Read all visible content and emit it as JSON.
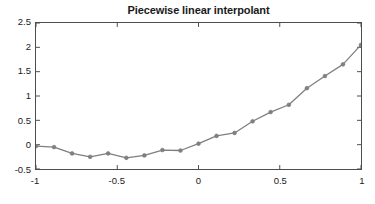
{
  "chart_data": {
    "type": "line",
    "title": "Piecewise linear interpolant",
    "xlabel": "",
    "ylabel": "",
    "xlim": [
      -1,
      1
    ],
    "ylim": [
      -0.5,
      2.5
    ],
    "grid": false,
    "legend": false,
    "legend_position": "none",
    "xticks": [
      -1,
      -0.5,
      0,
      0.5,
      1
    ],
    "xticklabels": [
      "-1",
      "-0.5",
      "0",
      "0.5",
      "1"
    ],
    "yticks": [
      -0.5,
      0,
      0.5,
      1,
      1.5,
      2,
      2.5
    ],
    "yticklabels": [
      "-0.5",
      "0",
      "0.5",
      "1",
      "1.5",
      "2",
      "2.5"
    ],
    "line_color": "#7f7f7f",
    "marker": "circle",
    "marker_color": "#7f7f7f",
    "x": [
      -1.0,
      -0.889,
      -0.778,
      -0.667,
      -0.556,
      -0.444,
      -0.333,
      -0.222,
      -0.111,
      0.0,
      0.111,
      0.222,
      0.333,
      0.444,
      0.556,
      0.667,
      0.778,
      0.889,
      1.0
    ],
    "y": [
      -0.03,
      -0.05,
      -0.18,
      -0.25,
      -0.18,
      -0.27,
      -0.22,
      -0.11,
      -0.12,
      0.02,
      0.18,
      0.24,
      0.48,
      0.67,
      0.82,
      1.16,
      1.41,
      1.65,
      2.05
    ],
    "series": [
      {
        "name": "Piecewise linear interpolant",
        "x": [
          -1.0,
          -0.889,
          -0.778,
          -0.667,
          -0.556,
          -0.444,
          -0.333,
          -0.222,
          -0.111,
          0.0,
          0.111,
          0.222,
          0.333,
          0.444,
          0.556,
          0.667,
          0.778,
          0.889,
          1.0
        ],
        "values": [
          -0.03,
          -0.05,
          -0.18,
          -0.25,
          -0.18,
          -0.27,
          -0.22,
          -0.11,
          -0.12,
          0.02,
          0.18,
          0.24,
          0.48,
          0.67,
          0.82,
          1.16,
          1.41,
          1.65,
          2.05
        ]
      }
    ]
  },
  "axis": {
    "border_color": "#4d4d4d",
    "tick_color": "#4d4d4d",
    "background": "#ffffff"
  }
}
